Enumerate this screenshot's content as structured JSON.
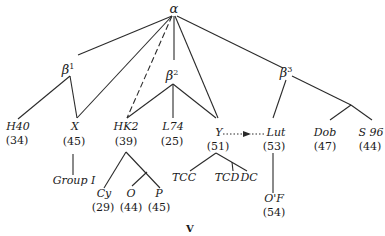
{
  "figure": {
    "caption": "V",
    "root": {
      "label": "α"
    },
    "groups": [
      {
        "label": "β",
        "sup": "1"
      },
      {
        "label": "β",
        "sup": "2"
      },
      {
        "label": "β",
        "sup": "3"
      }
    ],
    "leaves": {
      "h40": {
        "name": "H40",
        "count": "(34)"
      },
      "x": {
        "name": "X",
        "count": "(45)"
      },
      "hk2": {
        "name": "HK2",
        "count": "(39)"
      },
      "l74": {
        "name": "L74",
        "count": "(25)"
      },
      "y": {
        "name": "Y",
        "count": "(51)"
      },
      "lut": {
        "name": "Lut",
        "count": "(53)"
      },
      "dob": {
        "name": "Dob",
        "count": "(47)"
      },
      "s96": {
        "name": "S 96",
        "count": "(44)"
      },
      "group1": {
        "name": "Group I"
      },
      "cy": {
        "name": "Cy",
        "count": "(29)"
      },
      "o": {
        "name": "O",
        "count": "(44)"
      },
      "p": {
        "name": "P",
        "count": "(45)"
      },
      "tcc": {
        "name": "TCC"
      },
      "tcd": {
        "name": "TCD"
      },
      "dc": {
        "name": "DC"
      },
      "of": {
        "name": "O'F",
        "count": "(54)"
      }
    },
    "edges": [
      [
        "α",
        "β1"
      ],
      [
        "α",
        "X"
      ],
      [
        "α",
        "HK2 (dashed)"
      ],
      [
        "α",
        "β2"
      ],
      [
        "α",
        "Y"
      ],
      [
        "α",
        "β3"
      ],
      [
        "β1",
        "H40"
      ],
      [
        "β1",
        "X"
      ],
      [
        "β2",
        "HK2"
      ],
      [
        "β2",
        "L74"
      ],
      [
        "β2",
        "Y"
      ],
      [
        "β3",
        "Lut"
      ],
      [
        "β3",
        "Dob"
      ],
      [
        "β3",
        "S 96"
      ],
      [
        "X",
        "Group I"
      ],
      [
        "HK2",
        "Cy"
      ],
      [
        "HK2",
        "O"
      ],
      [
        "HK2",
        "P"
      ],
      [
        "Y",
        "TCC"
      ],
      [
        "Y",
        "TCD"
      ],
      [
        "Y",
        "DC"
      ],
      [
        "Y",
        "Lut (dotted arrow)"
      ],
      [
        "Lut",
        "O'F"
      ]
    ]
  }
}
